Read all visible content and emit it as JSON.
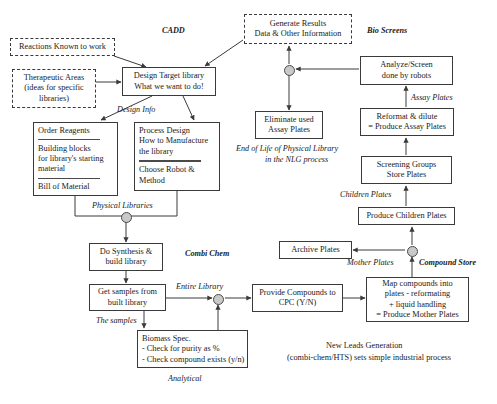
{
  "diagram": {
    "title_text": "New Leads Generation",
    "subtitle_text": "(combi-chem/HTS) sets simple industrial process",
    "nodes": [
      {
        "id": "reactions",
        "lines": [
          "Reactions Known to work"
        ]
      },
      {
        "id": "therapeutic",
        "lines": [
          "Therapeutic Areas",
          "(ideas for specific",
          "libraries)"
        ]
      },
      {
        "id": "design_target",
        "lines": [
          "Design Target library",
          "What we want to do!"
        ]
      },
      {
        "id": "order_reagents",
        "lines": [
          "Order Reagents",
          "Building blocks",
          "for library's starting",
          "material",
          "Bill of Material"
        ]
      },
      {
        "id": "process_design",
        "lines": [
          "Process Design",
          "How to Manufacture",
          "the library",
          "Choose Robot &",
          "Method"
        ]
      },
      {
        "id": "do_synthesis",
        "lines": [
          "Do Synthesis &",
          "build library"
        ]
      },
      {
        "id": "get_samples",
        "lines": [
          "Get samples from",
          "built library"
        ]
      },
      {
        "id": "biomass",
        "lines": [
          "Biomass Spec.",
          "- Check for purity as %",
          "- Check compound exists (y/n)"
        ]
      },
      {
        "id": "provide_cpc",
        "lines": [
          "Provide Compounds to",
          "CPC (Y/N)"
        ]
      },
      {
        "id": "map_compounds",
        "lines": [
          "Map compounds into",
          "plates - reformating",
          "+ liquid handling",
          "= Produce Mother Plates"
        ]
      },
      {
        "id": "archive",
        "lines": [
          "Archive Plates"
        ]
      },
      {
        "id": "produce_children",
        "lines": [
          "Produce Children Plates"
        ]
      },
      {
        "id": "screening_groups",
        "lines": [
          "Screening Groups",
          "Store Plates"
        ]
      },
      {
        "id": "reformat",
        "lines": [
          "Reformat & dilute",
          "= Produce Assay Plates"
        ]
      },
      {
        "id": "analyze",
        "lines": [
          "Analyze/Screen",
          "done by robots"
        ]
      },
      {
        "id": "generate",
        "lines": [
          "Generate Results",
          "Data & Other Information"
        ]
      },
      {
        "id": "eliminate",
        "lines": [
          "Eliminate used",
          "Assay Plates"
        ]
      }
    ],
    "swimlanes": [
      {
        "id": "cadd",
        "text": "CADD"
      },
      {
        "id": "combi_chem",
        "text": "Combi Chem"
      },
      {
        "id": "bio_screens",
        "text": "Bio Screens"
      },
      {
        "id": "compound_store",
        "text": "Compound Store"
      }
    ],
    "edge_labels": [
      {
        "id": "design_info",
        "text": "Design Info"
      },
      {
        "id": "physical_libs",
        "text": "Physical Libraries"
      },
      {
        "id": "entire_library",
        "text": "Entire Library"
      },
      {
        "id": "the_samples",
        "text": "The samples"
      },
      {
        "id": "analytical",
        "text": "Analytical"
      },
      {
        "id": "mother_plates",
        "text": "Mother Plates"
      },
      {
        "id": "children_plates",
        "text": "Children Plates"
      },
      {
        "id": "assay_plates",
        "text": "Assay Plates"
      }
    ],
    "annotations": [
      {
        "id": "end_of_life_1",
        "text": "End of Life of Physical Library"
      },
      {
        "id": "end_of_life_2",
        "text": "in the NLG process"
      }
    ],
    "colors": {
      "stroke": "#3a3a3a",
      "junction_fill": "#c9c9c9",
      "text": "#1a1a1a",
      "background": "#ffffff"
    }
  }
}
